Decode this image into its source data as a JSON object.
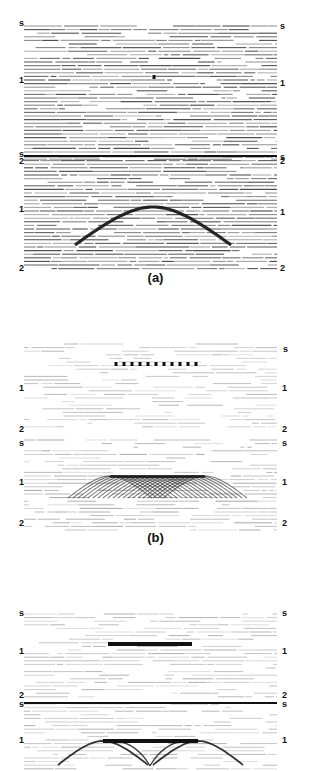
{
  "figure": {
    "captions": {
      "a": "(a)",
      "b": "(b)"
    },
    "axis_labels": {
      "top": "s",
      "mid": "1",
      "bottom": "2"
    },
    "colors": {
      "trace": "#333333",
      "background": "#ffffff",
      "event": "#111111"
    },
    "panels": [
      {
        "id": "a1",
        "top": 22,
        "height": 140,
        "density": 1.0,
        "noise": 0.15,
        "event": "point",
        "points": [
          [
            154,
            55
          ]
        ]
      },
      {
        "id": "a2",
        "top": 153,
        "height": 120,
        "density": 1.0,
        "noise": 0.1,
        "event": "hyperbola",
        "apex": [
          153,
          54
        ],
        "half_width": 78,
        "drop": 38
      },
      {
        "id": "b1",
        "top": 340,
        "height": 90,
        "density": 0.5,
        "noise": 0.7,
        "event": "points",
        "points": [
          [
            116,
            24
          ],
          [
            124,
            24
          ],
          [
            132,
            24
          ],
          [
            140,
            24
          ],
          [
            148,
            24
          ],
          [
            156,
            24
          ],
          [
            164,
            24
          ],
          [
            172,
            24
          ],
          [
            180,
            24
          ],
          [
            188,
            24
          ],
          [
            196,
            24
          ]
        ]
      },
      {
        "id": "b2",
        "top": 436,
        "height": 96,
        "density": 0.6,
        "noise": 0.6,
        "event": "hyperbola_bundle",
        "apex": [
          153,
          40
        ],
        "left": 110,
        "right": 205,
        "half_width": 42,
        "drop": 22
      },
      {
        "id": "c1",
        "top": 610,
        "height": 92,
        "density": 0.55,
        "noise": 0.65,
        "event": "bar",
        "bar": [
          108,
          32,
          84,
          4
        ]
      },
      {
        "id": "c2",
        "top": 700,
        "height": 71,
        "density": 0.55,
        "noise": 0.65,
        "event": "twin_hyperbola",
        "apex": [
          153,
          41
        ],
        "left": 103,
        "right": 198,
        "half_width": 45,
        "drop": 24,
        "cross": [
          150,
          66
        ]
      }
    ],
    "panel_labels": [
      {
        "panel": "a1",
        "items": [
          [
            "s",
            19,
            0,
            "left"
          ],
          [
            "s",
            280,
            3,
            "right"
          ],
          [
            "1",
            19,
            57,
            "left"
          ],
          [
            "1",
            280,
            60,
            "right"
          ],
          [
            "2",
            19,
            138,
            "left"
          ],
          [
            "2",
            280,
            138,
            "right"
          ]
        ]
      },
      {
        "panel": "a2",
        "items": [
          [
            "s",
            19,
            0,
            "left"
          ],
          [
            "s",
            280,
            3,
            "right"
          ],
          [
            "1",
            19,
            55,
            "left"
          ],
          [
            "1",
            280,
            58,
            "right"
          ],
          [
            "2",
            19,
            114,
            "left"
          ],
          [
            "2",
            280,
            114,
            "right"
          ]
        ]
      },
      {
        "panel": "b1",
        "items": [
          [
            "s",
            283,
            8,
            "right"
          ],
          [
            "1",
            19,
            47,
            "left"
          ],
          [
            "1",
            282,
            47,
            "right"
          ],
          [
            "2",
            19,
            88,
            "left"
          ],
          [
            "2",
            282,
            88,
            "right"
          ]
        ]
      },
      {
        "panel": "b2",
        "items": [
          [
            "s",
            19,
            6,
            "left"
          ],
          [
            "s",
            282,
            6,
            "right"
          ],
          [
            "1",
            19,
            45,
            "left"
          ],
          [
            "1",
            282,
            45,
            "right"
          ],
          [
            "2",
            19,
            86,
            "left"
          ],
          [
            "2",
            282,
            86,
            "right"
          ]
        ]
      },
      {
        "panel": "c1",
        "items": [
          [
            "s",
            19,
            2,
            "left"
          ],
          [
            "s",
            282,
            2,
            "right"
          ],
          [
            "1",
            19,
            40,
            "left"
          ],
          [
            "1",
            282,
            40,
            "right"
          ],
          [
            "2",
            19,
            84,
            "left"
          ],
          [
            "2",
            282,
            84,
            "right"
          ]
        ]
      },
      {
        "panel": "c2",
        "items": [
          [
            "s",
            19,
            3,
            "left"
          ],
          [
            "s",
            282,
            3,
            "right"
          ],
          [
            "1",
            19,
            39,
            "left"
          ],
          [
            "1",
            282,
            39,
            "right"
          ]
        ]
      }
    ]
  }
}
